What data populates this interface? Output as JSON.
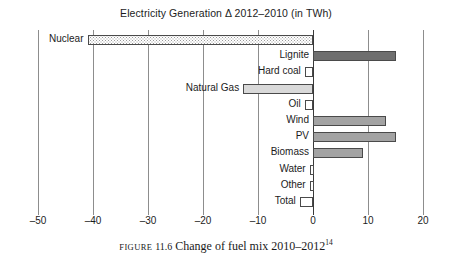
{
  "chart_data": {
    "type": "bar",
    "orientation": "horizontal",
    "title": "Electricity Generation Δ 2012–2010 (in TWh)",
    "xlabel": "",
    "ylabel": "",
    "xlim": [
      -55,
      23
    ],
    "grid": true,
    "legend": null,
    "xticks": [
      -50,
      -40,
      -30,
      -20,
      -10,
      0,
      10,
      20
    ],
    "xtick_labels": [
      "–50",
      "–40",
      "–30",
      "–20",
      "–10",
      "0",
      "10",
      "20"
    ],
    "categories": [
      "Nuclear",
      "Lignite",
      "Hard coal",
      "Natural Gas",
      "Oil",
      "Wind",
      "PV",
      "Biomass",
      "Water",
      "Other",
      "Total"
    ],
    "values": [
      -41.0,
      15.1,
      -1.5,
      -12.7,
      -1.5,
      13.3,
      15.1,
      9.1,
      -0.6,
      -0.6,
      -2.4
    ],
    "bar_styles": [
      "stipple",
      "dark",
      "white",
      "light",
      "white",
      "mid",
      "mid",
      "mid",
      "white",
      "white",
      "white"
    ]
  },
  "caption": {
    "figure_word": "Figure",
    "figure_number": "11.6",
    "text": "Change of fuel mix 2010–2012",
    "footnote": "14"
  },
  "colors": {
    "dark": "#6f6f6f",
    "mid": "#a3a3a3",
    "light": "#d9d9d9",
    "white": "#ffffff",
    "grid": "#8d8d8d",
    "zero_axis": "#3a3a3a",
    "text": "#1c1c1c"
  }
}
